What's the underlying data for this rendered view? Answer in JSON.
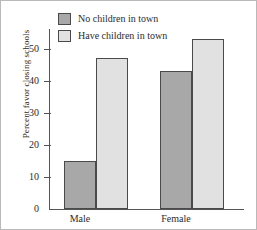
{
  "chart_data": {
    "type": "bar",
    "title": "",
    "xlabel": "",
    "ylabel": "Percent favor closing schools",
    "categories": [
      "Male",
      "Female"
    ],
    "series": [
      {
        "name": "No children in town",
        "values": [
          15,
          43
        ],
        "color": "#a8a8a8"
      },
      {
        "name": "Have children in town",
        "values": [
          47,
          53
        ],
        "color": "#e1e1e1"
      }
    ],
    "ylim": [
      0,
      56
    ],
    "yticks": [
      0,
      10,
      20,
      30,
      40,
      50
    ],
    "ytick_labels": [
      "0",
      "10",
      "20",
      "30",
      "40",
      "50"
    ],
    "grid": false,
    "legend_position": "top-left",
    "bar_edge_color": "#4a4a4a",
    "axis_color": "#555555"
  },
  "legend": {
    "items": [
      {
        "label": "No children in town"
      },
      {
        "label": "Have children in town"
      }
    ]
  }
}
